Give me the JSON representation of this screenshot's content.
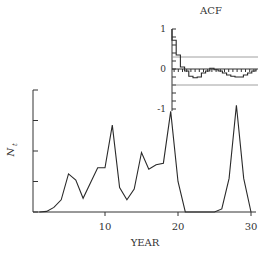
{
  "chart_data": [
    {
      "type": "line",
      "title": "",
      "xlabel": "YEAR",
      "ylabel": "N_t",
      "xlim": [
        0,
        30
      ],
      "ylim": [
        0,
        4
      ],
      "xticks": [
        10,
        20,
        30
      ],
      "xtick_labels": [
        "10",
        "20",
        "30"
      ],
      "yticks": [
        0,
        1,
        2,
        3,
        4
      ],
      "ytick_labels": [
        "",
        "",
        "",
        "",
        ""
      ],
      "grid": false,
      "x": [
        1,
        2,
        3,
        4,
        5,
        6,
        7,
        8,
        9,
        10,
        11,
        12,
        13,
        14,
        15,
        16,
        17,
        18,
        19,
        20,
        21,
        22,
        23,
        24,
        25,
        26,
        27,
        28,
        29,
        30
      ],
      "values": [
        0.0,
        0.02,
        0.15,
        0.4,
        1.25,
        1.05,
        0.45,
        0.95,
        1.45,
        1.45,
        2.85,
        0.8,
        0.4,
        0.75,
        1.95,
        1.4,
        1.55,
        1.6,
        3.3,
        1.0,
        0.0,
        0.0,
        0.0,
        0.0,
        0.0,
        0.1,
        1.1,
        3.5,
        1.1,
        0.0
      ]
    },
    {
      "type": "line",
      "title": "ACF",
      "xlabel": "",
      "ylabel": "",
      "ylim": [
        -1,
        1
      ],
      "yticks": [
        -1,
        0,
        1
      ],
      "ytick_labels": [
        "-1",
        "0",
        "1"
      ],
      "confidence_bounds": [
        0.3,
        -0.4
      ],
      "lags": [
        0,
        1,
        2,
        3,
        4,
        5,
        6,
        7,
        8,
        9,
        10,
        11,
        12,
        13,
        14,
        15,
        16,
        17,
        18,
        19
      ],
      "values": [
        0.72,
        0.35,
        0.05,
        -0.05,
        -0.18,
        -0.22,
        -0.2,
        -0.1,
        -0.05,
        0.02,
        -0.02,
        -0.05,
        -0.1,
        -0.15,
        -0.18,
        -0.2,
        -0.2,
        -0.15,
        -0.1,
        -0.05
      ]
    }
  ],
  "labels": {
    "main_xlabel": "YEAR",
    "main_ylabel": "N",
    "main_ylabel_sub": "t",
    "acf_title": "ACF",
    "acf_tick_top": "1",
    "acf_tick_mid": "0",
    "acf_tick_bottom": "-1",
    "xtick_10": "10",
    "xtick_20": "20",
    "xtick_30": "30"
  }
}
